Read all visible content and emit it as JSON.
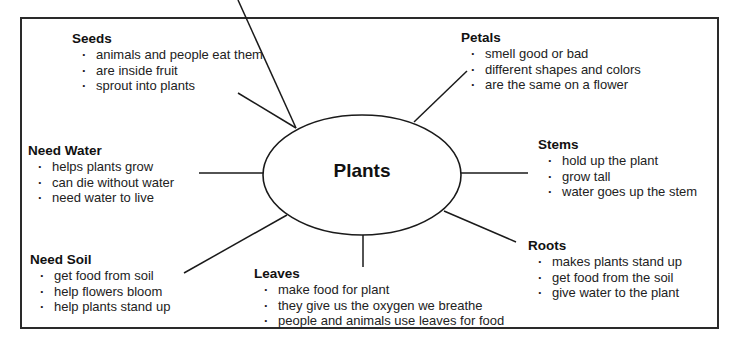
{
  "diagram": {
    "type": "concept-web",
    "center": "Plants",
    "topics": [
      {
        "id": "seeds",
        "title": "Seeds",
        "items": [
          "animals and people eat them",
          "are inside fruit",
          "sprout into plants"
        ]
      },
      {
        "id": "petals",
        "title": "Petals",
        "items": [
          "smell good or bad",
          "different shapes and colors",
          "are the same on a flower"
        ]
      },
      {
        "id": "need-water",
        "title": "Need Water",
        "items": [
          "helps plants grow",
          "can die without water",
          "need water to live"
        ]
      },
      {
        "id": "stems",
        "title": "Stems",
        "items": [
          "hold up the plant",
          "grow tall",
          "water goes up the stem"
        ]
      },
      {
        "id": "need-soil",
        "title": "Need Soil",
        "items": [
          "get food from soil",
          "help flowers bloom",
          "help plants stand up"
        ]
      },
      {
        "id": "leaves",
        "title": "Leaves",
        "items": [
          "make food for plant",
          "they give us the oxygen we breathe",
          "people and animals use leaves for food"
        ]
      },
      {
        "id": "roots",
        "title": "Roots",
        "items": [
          "makes plants stand up",
          "get food from the soil",
          "give water to the plant"
        ]
      }
    ],
    "colors": {
      "line": "#1a1a1a",
      "text": "#1a1a1a",
      "background": "#ffffff"
    }
  }
}
